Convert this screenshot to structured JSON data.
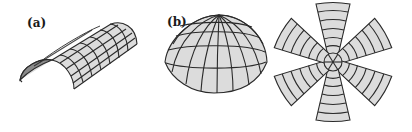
{
  "figure": {
    "panels": [
      {
        "id": "a",
        "label": "(a)",
        "shape": "half-cylinder surface with quadrilateral grid mesh"
      },
      {
        "id": "b",
        "label": "(b)",
        "shape": "hemispherical dome with latitude-longitude grid mesh"
      },
      {
        "id": "c",
        "label": "",
        "shape": "flattened six-petal star pattern of the dome gores"
      }
    ],
    "colors": {
      "surface_fill": "#dcdcdc",
      "end_cap_fill": "#8a8a8a",
      "grid_line": "#2a2a2a",
      "background": "#ffffff"
    }
  }
}
